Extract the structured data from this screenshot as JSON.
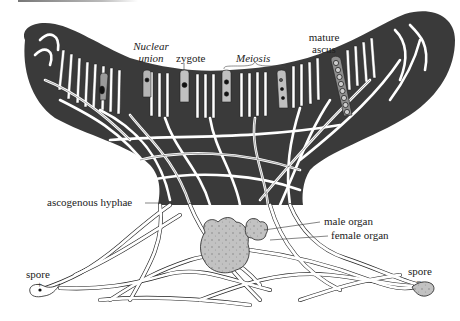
{
  "figure": {
    "type": "biological life-cycle diagram"
  },
  "labels": {
    "nuclear_union_line1": "Nuclear",
    "nuclear_union_line2": "union",
    "zygote": "zygote",
    "meiosis": "Meiosis",
    "mature_ascus_line1": "mature",
    "mature_ascus_line2": "ascus",
    "ascogenous_hyphae": "ascogenous hyphae",
    "male_organ": "male organ",
    "female_organ": "female organ",
    "spore_left": "spore",
    "spore_left_sign": "+",
    "spore_right": "spore",
    "spore_right_sign": "−"
  },
  "colors": {
    "cup_fill": "#3a3a3a",
    "hypha_fill": "#ffffff",
    "hypha_stroke": "#222222",
    "organ_fill": "#bdbdbd",
    "label_text": "#222222"
  }
}
